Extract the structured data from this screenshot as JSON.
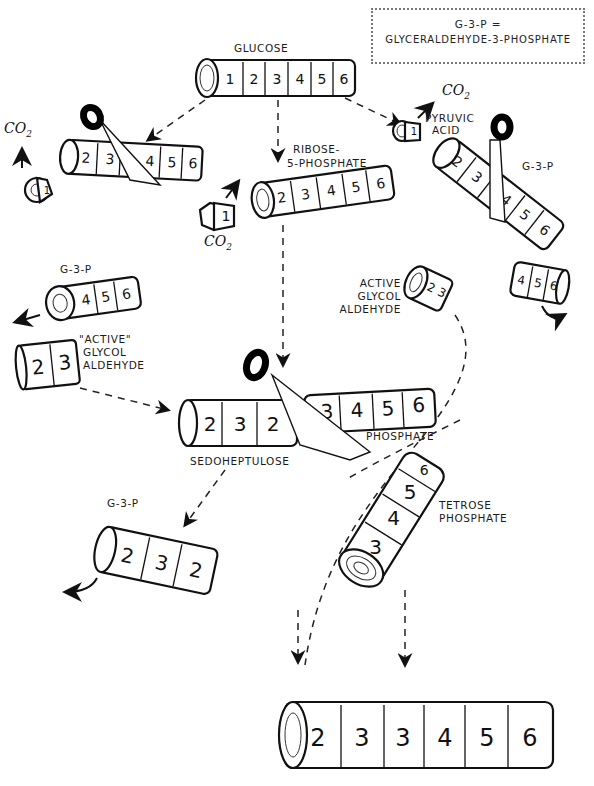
{
  "legend": {
    "key": "G-3-P =",
    "value": "GLYCERALDEHYDE-3-PHOSPHATE"
  },
  "labels": {
    "glucose": "GLUCOSE",
    "ribose_line1": "RIBOSE-",
    "ribose_line2": "5-PHOSPHATE",
    "pyruvic_line1": "PYRUVIC",
    "pyruvic_line2": "ACID",
    "g3p_right": "G-3-P",
    "g3p_left": "G-3-P",
    "active_left_line1": "\"ACTIVE\"",
    "active_left_line2": "GLYCOL",
    "active_left_line3": "ALDEHYDE",
    "active_right_line1": "ACTIVE",
    "active_right_line2": "GLYCOL",
    "active_right_line3": "ALDEHYDE",
    "sedoheptulose": "SEDOHEPTULOSE",
    "phosphate": "PHOSPHATE",
    "g3p_bottom": "G-3-P",
    "tetrose_line1": "TETROSE",
    "tetrose_line2": "PHOSPHATE",
    "co2_left": "CO",
    "co2_mid": "CO",
    "co2_right": "CO",
    "co2_sub": "2"
  },
  "logs": {
    "glucose": [
      "1",
      "2",
      "3",
      "4",
      "5",
      "6"
    ],
    "left_cut": [
      "2",
      "3",
      "4",
      "5",
      "6"
    ],
    "left_end_piece": [
      "1"
    ],
    "ribose_5_phosphate": [
      "2",
      "3",
      "4",
      "5",
      "6"
    ],
    "ribose_cut_piece": [
      "1"
    ],
    "right_end_piece": [
      "1"
    ],
    "right_cut": [
      "2",
      "3",
      "4",
      "5",
      "6"
    ],
    "g3p_left_piece": [
      "4",
      "5",
      "6"
    ],
    "active_glycol_left": [
      "2",
      "3"
    ],
    "active_glycol_right": [
      "2",
      "3"
    ],
    "g3p_right_piece": [
      "4",
      "5",
      "6"
    ],
    "sedoheptulose": [
      "2",
      "3",
      "2"
    ],
    "phosphate_piece": [
      "3",
      "4",
      "5",
      "6"
    ],
    "g3p_bottom": [
      "2",
      "3",
      "2"
    ],
    "tetrose_phosphate": [
      "3",
      "4",
      "5",
      "6"
    ],
    "final_product": [
      "2",
      "3",
      "3",
      "4",
      "5",
      "6"
    ]
  }
}
